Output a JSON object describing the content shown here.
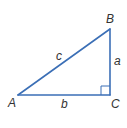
{
  "diagram": {
    "type": "right-triangle",
    "line_color": "#3b6fb6",
    "label_color": "#333333",
    "vertices": {
      "A": "A",
      "B": "B",
      "C": "C"
    },
    "sides": {
      "a": "a",
      "b": "b",
      "c": "c"
    },
    "right_angle_at": "C"
  }
}
